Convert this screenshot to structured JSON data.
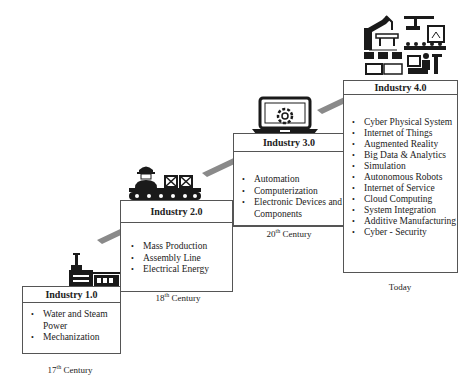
{
  "stages": [
    {
      "title": "Industry 1.0",
      "icon": "factory-icon",
      "items": [
        "Water and Steam Power",
        "Mechanization"
      ],
      "era_number": "17",
      "era_suffix": "th",
      "era_word": "Century"
    },
    {
      "title": "Industry 2.0",
      "icon": "assembly-line-worker-icon",
      "items": [
        "Mass Production",
        "Assembly Line",
        "Electrical Energy"
      ],
      "era_number": "18",
      "era_suffix": "th",
      "era_word": "Century"
    },
    {
      "title": "Industry 3.0",
      "icon": "laptop-gear-icon",
      "items": [
        "Automation",
        "Computerization",
        "Electronic Devices and Components"
      ],
      "era_number": "20",
      "era_suffix": "th",
      "era_word": "Century"
    },
    {
      "title": "Industry 4.0",
      "icon": "smart-factory-icon",
      "items": [
        "Cyber Physical System",
        "Internet of Things",
        "Augmented Reality",
        "Big Data & Analytics",
        "Simulation",
        "Autonomous Robots",
        "Internet of Service",
        "Cloud Computing",
        "System Integration",
        "Additive Manufacturing",
        "Cyber - Security"
      ],
      "era_label": "Today"
    }
  ],
  "colors": {
    "arrow": "#8a8a8a",
    "border": "#555555",
    "icon": "#1a1a1a"
  }
}
